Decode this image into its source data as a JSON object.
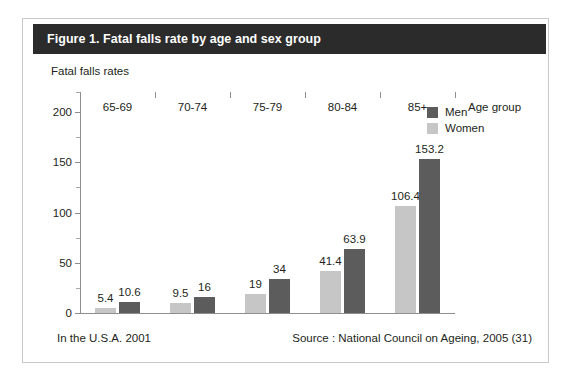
{
  "figure": {
    "title": "Figure 1. Fatal falls rate by age and sex group",
    "note": "In the U.S.A. 2001",
    "source": "Source : National Council on Ageing, 2005 (31)"
  },
  "chart_data": {
    "type": "bar",
    "title": "Figure 1. Fatal falls rate by age and sex group",
    "xlabel": "Age group",
    "ylabel": "Fatal falls rates",
    "categories": [
      "65-69",
      "70-74",
      "75-79",
      "80-84",
      "85+"
    ],
    "series": [
      {
        "name": "Women",
        "color": "#c6c6c6",
        "values": [
          5.4,
          9.5,
          19,
          41.4,
          106.4
        ],
        "labels": [
          "5.4",
          "9.5",
          "19",
          "41.4",
          "106.4"
        ]
      },
      {
        "name": "Men",
        "color": "#5c5c5c",
        "values": [
          10.6,
          16,
          34,
          63.9,
          153.2
        ],
        "labels": [
          "10.6",
          "16",
          "34",
          "63.9",
          "153.2"
        ]
      }
    ],
    "ylim": [
      0,
      220
    ],
    "yticks": [
      0,
      50,
      100,
      150,
      200
    ],
    "ytick_labels": [
      "0",
      "50",
      "100",
      "150",
      "200"
    ],
    "yminor_ticks": [
      25,
      75,
      125,
      175
    ],
    "grid": false,
    "legend_position": "top-right",
    "legend_entries": [
      "Men",
      "Women"
    ]
  },
  "colors": {
    "title_bar": "#2b2b2b",
    "title_text": "#ffffff",
    "frame_border": "#c9c9c9",
    "axis": "#8e8e8e",
    "men": "#5c5c5c",
    "women": "#c6c6c6"
  }
}
